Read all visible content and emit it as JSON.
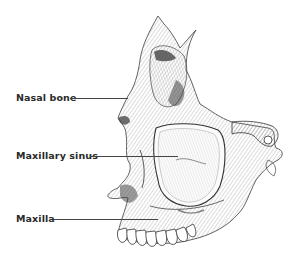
{
  "diagram": {
    "labels": [
      {
        "id": "nasal-bone",
        "text": "Nasal bone",
        "x": 16,
        "y": 92,
        "line_x1": 70,
        "line_x2": 128,
        "line_y": 98
      },
      {
        "id": "maxillary-sinus",
        "text": "Maxillary sinus",
        "x": 16,
        "y": 150,
        "line_x1": 90,
        "line_x2": 178,
        "line_y": 156
      },
      {
        "id": "maxilla",
        "text": "Maxilla",
        "x": 16,
        "y": 213,
        "line_x1": 54,
        "line_x2": 158,
        "line_y": 219
      }
    ],
    "colors": {
      "ink": "#2a2a2a",
      "shade": "#555555",
      "background": "#ffffff"
    }
  }
}
